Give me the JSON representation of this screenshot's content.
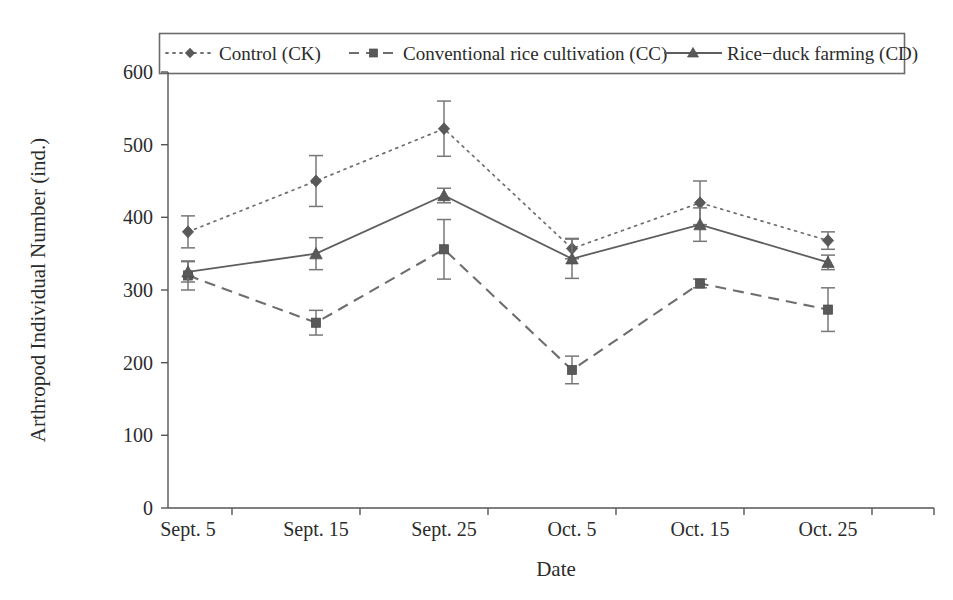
{
  "chart_data": {
    "type": "line",
    "title": "",
    "xlabel": "Date",
    "ylabel": "Arthropod Individual Number (ind.)",
    "categories": [
      "Sept. 5",
      "Sept. 15",
      "Sept. 25",
      "Oct. 5",
      "Oct. 15",
      "Oct. 25"
    ],
    "ylim": [
      0,
      600
    ],
    "yticks": [
      0,
      100,
      200,
      300,
      400,
      500,
      600
    ],
    "ytick_labels": [
      "0",
      "100",
      "200",
      "300",
      "400",
      "500",
      "600"
    ],
    "grid": false,
    "legend_position": "top-center-outside",
    "error_bars": true,
    "series": [
      {
        "name": "Control (CK)",
        "code": "CK",
        "marker": "diamond",
        "linestyle": "dotted",
        "color": "#6e6e6e",
        "values": [
          380,
          450,
          522,
          357,
          420,
          368
        ],
        "errors": [
          22,
          35,
          38,
          14,
          30,
          12
        ]
      },
      {
        "name": "Conventional rice cultivation (CC)",
        "code": "CC",
        "marker": "square",
        "linestyle": "dashed",
        "color": "#6e6e6e",
        "values": [
          320,
          255,
          356,
          190,
          309,
          273
        ],
        "errors": [
          20,
          17,
          41,
          19,
          6,
          30
        ]
      },
      {
        "name": "Rice-duck farming (CD)",
        "code": "CD",
        "marker": "triangle",
        "linestyle": "solid",
        "color": "#5e5e5e",
        "values": [
          325,
          350,
          430,
          343,
          390,
          338
        ],
        "errors": [
          14,
          22,
          10,
          27,
          23,
          10
        ]
      }
    ]
  },
  "legend": {
    "entries": [
      {
        "label": "Control (CK)"
      },
      {
        "label": "Conventional rice cultivation (CC)"
      },
      {
        "label": "Rice−duck farming (CD)"
      }
    ]
  },
  "axes": {
    "y_title": "Arthropod Individual Number (ind.)",
    "x_title": "Date",
    "y_ticks": [
      "600",
      "500",
      "400",
      "300",
      "200",
      "100",
      "0"
    ],
    "x_ticks": [
      "Sept. 5",
      "Sept. 15",
      "Sept. 25",
      "Oct. 5",
      "Oct. 15",
      "Oct. 25"
    ]
  },
  "colors": {
    "axis": "#555555",
    "series_ck": "#6e6e6e",
    "series_cc": "#6e6e6e",
    "series_cd": "#5e5e5e",
    "text": "#2b2b2b",
    "background": "#ffffff"
  }
}
